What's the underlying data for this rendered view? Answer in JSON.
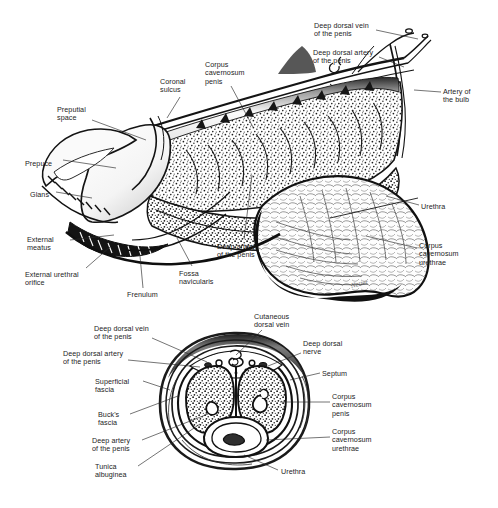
{
  "figure": {
    "type": "anatomical-illustration",
    "background_color": "#ffffff",
    "ink_color": "#1a1a1a",
    "label_color": "#1d1d1d",
    "artist_signature": "Netter"
  },
  "panels": [
    {
      "id": "sagittal",
      "name": "Longitudinal sagittal section of the penis",
      "labels": [
        {
          "id": "deep-dorsal-vein-of-the-penis",
          "text": "Deep dorsal vein\nof the penis",
          "align": "left",
          "x": 314,
          "y": 22
        },
        {
          "id": "deep-dorsal-artery-of-the-penis",
          "text": "Deep dorsal artery\nof the penis",
          "align": "left",
          "x": 313,
          "y": 49
        },
        {
          "id": "artery-of-the-bulb",
          "text": "Artery of\nthe bulb",
          "align": "left",
          "x": 443,
          "y": 88
        },
        {
          "id": "corpus-cavernosum-penis",
          "text": "Corpus\ncavernosum\npenis",
          "align": "left",
          "x": 205,
          "y": 61
        },
        {
          "id": "coronal-sulcus",
          "text": "Coronal\nsulcus",
          "align": "left",
          "x": 160,
          "y": 78
        },
        {
          "id": "preputial-space",
          "text": "Preputial\nspace",
          "align": "left",
          "x": 57,
          "y": 106
        },
        {
          "id": "prepuce",
          "text": "Prepuce",
          "align": "left",
          "x": 25,
          "y": 160
        },
        {
          "id": "glans",
          "text": "Glans",
          "align": "left",
          "x": 30,
          "y": 191
        },
        {
          "id": "external-meatus",
          "text": "External\nmeatus",
          "align": "left",
          "x": 27,
          "y": 236
        },
        {
          "id": "external-urethral-orifice",
          "text": "External urethral\norifice",
          "align": "left",
          "x": 25,
          "y": 271
        },
        {
          "id": "frenulum",
          "text": "Frenulum",
          "align": "left",
          "x": 127,
          "y": 291
        },
        {
          "id": "fossa-navicularis",
          "text": "Fossa\nnavicularis",
          "align": "left",
          "x": 179,
          "y": 270
        },
        {
          "id": "deep-artery-of-the-penis",
          "text": "Deep artery\nof the penis",
          "align": "left",
          "x": 217,
          "y": 243
        },
        {
          "id": "urethra",
          "text": "Urethra",
          "align": "left",
          "x": 421,
          "y": 203
        },
        {
          "id": "corpus-cavernosum-urethrae",
          "text": "Corpus\ncavernosum\nurethrae",
          "align": "left",
          "x": 419,
          "y": 242
        }
      ]
    },
    {
      "id": "cross-section",
      "name": "Transverse cross-section of the penile shaft",
      "labels": [
        {
          "id": "cutaneous-dorsal-vein",
          "text": "Cutaneous\ndorsal vein",
          "align": "left",
          "x": 254,
          "y": 313
        },
        {
          "id": "deep-dorsal-vein-of-the-penis-xs",
          "text": "Deep dorsal vein\nof the penis",
          "align": "left",
          "x": 94,
          "y": 325
        },
        {
          "id": "deep-dorsal-nerve",
          "text": "Deep dorsal\nnerve",
          "align": "left",
          "x": 303,
          "y": 340
        },
        {
          "id": "deep-dorsal-artery-of-the-penis-xs",
          "text": "Deep dorsal artery\nof the penis",
          "align": "left",
          "x": 63,
          "y": 350
        },
        {
          "id": "septum",
          "text": "Septum",
          "align": "left",
          "x": 322,
          "y": 370
        },
        {
          "id": "superficial-fascia",
          "text": "Superficial\nfascia",
          "align": "left",
          "x": 95,
          "y": 378
        },
        {
          "id": "corpus-cavernosum-penis-xs",
          "text": "Corpus\ncavernosum\npenis",
          "align": "left",
          "x": 332,
          "y": 393
        },
        {
          "id": "bucks-fascia",
          "text": "Buck's\nfascia",
          "align": "left",
          "x": 98,
          "y": 411
        },
        {
          "id": "corpus-cavernosum-urethrae-xs",
          "text": "Corpus\ncavernosum\nurethrae",
          "align": "left",
          "x": 332,
          "y": 428
        },
        {
          "id": "deep-artery-of-the-penis-xs",
          "text": "Deep artery\nof the penis",
          "align": "left",
          "x": 92,
          "y": 437
        },
        {
          "id": "tunica-albuginea",
          "text": "Tunica\nalbuginea",
          "align": "left",
          "x": 95,
          "y": 463
        },
        {
          "id": "urethra-xs",
          "text": "Urethra",
          "align": "left",
          "x": 281,
          "y": 468
        }
      ]
    }
  ]
}
